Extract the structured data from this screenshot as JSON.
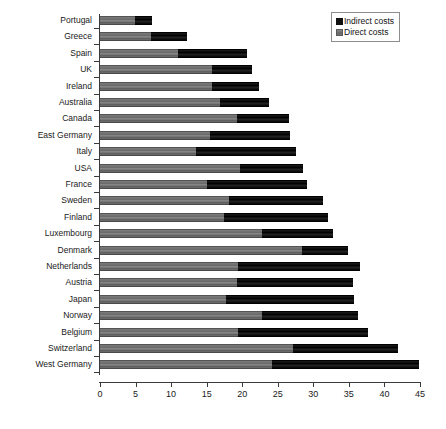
{
  "chart_data": {
    "type": "bar",
    "orientation": "horizontal",
    "stacked": true,
    "title": "",
    "xlabel": "",
    "ylabel": "",
    "xlim": [
      0,
      45
    ],
    "xticks": [
      0,
      5,
      10,
      15,
      20,
      25,
      30,
      35,
      40,
      45
    ],
    "grid": false,
    "legend_position": "top-right",
    "categories": [
      "Portugal",
      "Greece",
      "Spain",
      "UK",
      "Ireland",
      "Australia",
      "Canada",
      "East Germany",
      "Italy",
      "USA",
      "France",
      "Sweden",
      "Finland",
      "Luxembourg",
      "Denmark",
      "Netherlands",
      "Austria",
      "Japan",
      "Norway",
      "Belgium",
      "Switzerland",
      "West Germany"
    ],
    "series": [
      {
        "name": "Direct costs",
        "color": "#6f6f6f",
        "values": [
          4.9,
          7.2,
          11.0,
          15.8,
          15.8,
          16.9,
          19.3,
          15.5,
          13.5,
          19.7,
          15.0,
          18.2,
          17.4,
          22.8,
          28.4,
          19.4,
          19.2,
          17.7,
          22.8,
          19.4,
          27.1,
          24.2
        ]
      },
      {
        "name": "Indirect costs",
        "color": "#111111",
        "values": [
          2.4,
          5.0,
          9.7,
          5.6,
          6.6,
          6.9,
          7.3,
          11.2,
          14.1,
          8.9,
          14.1,
          13.1,
          14.7,
          10.0,
          6.5,
          17.2,
          16.4,
          18.0,
          13.5,
          18.3,
          14.8,
          20.6
        ]
      }
    ],
    "totals": [
      7.3,
      12.2,
      20.7,
      21.4,
      22.4,
      23.8,
      26.6,
      26.7,
      27.6,
      28.6,
      29.1,
      31.3,
      32.1,
      32.8,
      34.9,
      36.6,
      35.6,
      35.7,
      36.3,
      37.7,
      41.9,
      44.8
    ]
  },
  "legend": {
    "items": [
      {
        "label": "Indirect costs",
        "swatch": "black-square-icon"
      },
      {
        "label": "Direct costs",
        "swatch": "gray-square-icon"
      }
    ]
  },
  "caption": ""
}
